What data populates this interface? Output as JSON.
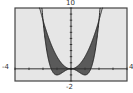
{
  "chart_data": {
    "type": "area",
    "title": "",
    "xlabel": "",
    "ylabel": "",
    "xlim": [
      -4,
      4
    ],
    "ylim": [
      -2,
      10
    ],
    "grid": false,
    "tick_labels": {
      "xmin": "-4",
      "xmax": "4",
      "ymin": "-2",
      "ymax": "10"
    },
    "series": [
      {
        "name": "f(x) = x^4 - 2x^2",
        "x": [
          -2.1,
          -2,
          -1.5,
          -1,
          -0.5,
          0,
          0.5,
          1,
          1.5,
          2,
          2.1
        ],
        "values": [
          10.63,
          8,
          0.56,
          -1,
          -0.44,
          0,
          -0.44,
          -1,
          0.56,
          8,
          10.63
        ]
      },
      {
        "name": "g(x) = 2x^2",
        "x": [
          -2.1,
          -2,
          -1.5,
          -1,
          -0.5,
          0,
          0.5,
          1,
          1.5,
          2,
          2.1
        ],
        "values": [
          8.82,
          8,
          4.5,
          2,
          0.5,
          0,
          0.5,
          2,
          4.5,
          8,
          8.82
        ]
      }
    ],
    "shaded_region": "between f and g for -2 <= x <= 2",
    "colors": {
      "background": "#e6e6e6",
      "fill": "#5a5a5a",
      "curve": "#222222",
      "axis": "#333333",
      "frame": "#444444"
    }
  }
}
